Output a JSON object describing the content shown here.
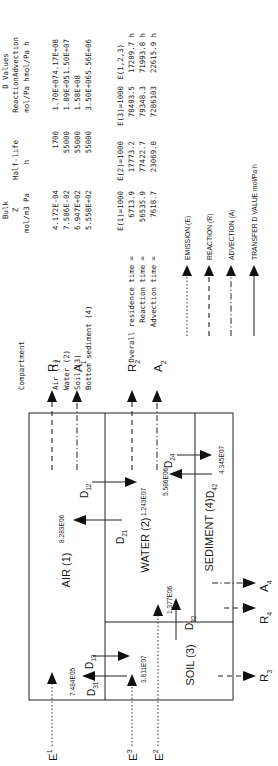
{
  "table": {
    "headers": {
      "compartment": "Compartment",
      "bulk_z": [
        "Bulk",
        "Z",
        "mol/m3 Pa"
      ],
      "half_life": [
        "Half-life",
        "h"
      ],
      "d_values_title": "D Values",
      "reaction": [
        "Reaction",
        "mol/Pa h"
      ],
      "advection": [
        "Advection",
        "mol/Pa h"
      ]
    },
    "rows": [
      {
        "compartment": "Air (1)",
        "z": "4.172E-04",
        "half_life": "1700",
        "reaction": "1.70E+07",
        "advection": "4.17E+08"
      },
      {
        "compartment": "Water (2)",
        "z": "7.506E-02",
        "half_life": "55000",
        "reaction": "1.89E+05",
        "advection": "1.50E+07"
      },
      {
        "compartment": "Soil (3)",
        "z": "6.947E+02",
        "half_life": "55000",
        "reaction": "1.58E+08",
        "advection": ""
      },
      {
        "compartment": "Bottom sediment (4)",
        "z": "5.558E+02",
        "half_life": "55000",
        "reaction": "3.50E+06",
        "advection": "5.56E+06"
      }
    ]
  },
  "times": {
    "columns": [
      "E(1)=1000",
      "E(2)=1000",
      "E(3)=1000",
      "E(1,2,3)"
    ],
    "rows": [
      {
        "label": "Overall residence time =",
        "values": [
          "6713.9",
          "17773.2",
          "78493.5",
          "17209.7 h"
        ]
      },
      {
        "label": "Reaction time =",
        "values": [
          "56535.9",
          "77422.7",
          "79348.3",
          "71993.8 h"
        ]
      },
      {
        "label": "Advection time =",
        "values": [
          "7618.7",
          "23069.0",
          "7286103",
          "22615.9 h"
        ]
      }
    ]
  },
  "legend": [
    {
      "style": "dotted",
      "label": "EMISSION (E)"
    },
    {
      "style": "dashed",
      "label": "REACTION (R)"
    },
    {
      "style": "dashdot",
      "label": "ADVECTION (A)"
    },
    {
      "style": "solid",
      "label": "TRANSFER D VALUE mol/Pa h"
    }
  ],
  "diagram": {
    "compartments": {
      "air": "AIR (1)",
      "water": "WATER (2)",
      "soil": "SOIL (3)",
      "sediment": "SEDIMENT (4)"
    },
    "transfers": {
      "D12": {
        "main": "D",
        "sub": "12",
        "value": "1.243E07"
      },
      "D21": {
        "main": "D",
        "sub": "21",
        "value": "8.283E06"
      },
      "D24": {
        "main": "D",
        "sub": "24",
        "value": "4.345E07"
      },
      "D42": {
        "main": "D",
        "sub": "42",
        "value": "5.586E06"
      },
      "D13": {
        "main": "D",
        "sub": "13",
        "value": "3.811E07"
      },
      "D31": {
        "main": "D",
        "sub": "31",
        "value": "7.484E05"
      },
      "D32": {
        "main": "D",
        "sub": "32",
        "value": "1.377E06"
      }
    },
    "flows": {
      "E1": {
        "main": "E",
        "sub": "1"
      },
      "E2": {
        "main": "E",
        "sub": "2"
      },
      "E3": {
        "main": "E",
        "sub": "3"
      },
      "R1": {
        "main": "R",
        "sub": "1"
      },
      "R2": {
        "main": "R",
        "sub": "2"
      },
      "R3": {
        "main": "R",
        "sub": "3"
      },
      "R4": {
        "main": "R",
        "sub": "4"
      },
      "A1": {
        "main": "A",
        "sub": "1"
      },
      "A2": {
        "main": "A",
        "sub": "2"
      },
      "A4": {
        "main": "A",
        "sub": "4"
      }
    }
  }
}
